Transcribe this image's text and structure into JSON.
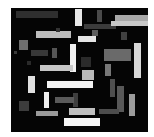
{
  "figure": {
    "width": 154,
    "height": 137,
    "background_color": "#ffffff"
  },
  "canvas": {
    "name": "black-canvas",
    "x": 11,
    "y": 8,
    "width": 137,
    "height": 124,
    "color": "#050505"
  },
  "chart_data": {
    "type": "scatter",
    "xlabel": "",
    "ylabel": "",
    "xlim": [
      0,
      137
    ],
    "ylim": [
      0,
      124
    ],
    "grid": false,
    "legend": "none",
    "note": "Abstract composition of axis-aligned grayscale rectangles on a black field.",
    "rectangles": [
      {
        "id": 1,
        "x": 5,
        "y": 3,
        "w": 42,
        "h": 7,
        "color": "#2f2f2f"
      },
      {
        "id": 2,
        "x": 64,
        "y": 1,
        "w": 7,
        "h": 17,
        "color": "#e8e8e8"
      },
      {
        "id": 3,
        "x": 86,
        "y": 2,
        "w": 5,
        "h": 12,
        "color": "#4a4a4a"
      },
      {
        "id": 4,
        "x": 104,
        "y": 7,
        "w": 36,
        "h": 6,
        "color": "#a8a8a8"
      },
      {
        "id": 5,
        "x": 73,
        "y": 16,
        "w": 32,
        "h": 5,
        "color": "#3b3b3b"
      },
      {
        "id": 6,
        "x": 100,
        "y": 13,
        "w": 38,
        "h": 5,
        "color": "#c8c8c8"
      },
      {
        "id": 7,
        "x": 25,
        "y": 23,
        "w": 35,
        "h": 7,
        "color": "#bdbdbd"
      },
      {
        "id": 8,
        "x": 8,
        "y": 32,
        "w": 9,
        "h": 10,
        "color": "#6e6e6e"
      },
      {
        "id": 9,
        "x": 67,
        "y": 28,
        "w": 18,
        "h": 6,
        "color": "#e5e5e5"
      },
      {
        "id": 10,
        "x": 3,
        "y": 43,
        "w": 3,
        "h": 3,
        "color": "#3a3a3a"
      },
      {
        "id": 11,
        "x": 20,
        "y": 42,
        "w": 17,
        "h": 6,
        "color": "#383838"
      },
      {
        "id": 12,
        "x": 41,
        "y": 40,
        "w": 5,
        "h": 10,
        "color": "#555555"
      },
      {
        "id": 13,
        "x": 59,
        "y": 36,
        "w": 6,
        "h": 28,
        "color": "#f0f0f0"
      },
      {
        "id": 14,
        "x": 93,
        "y": 41,
        "w": 27,
        "h": 12,
        "color": "#6a6a6a"
      },
      {
        "id": 15,
        "x": 123,
        "y": 35,
        "w": 7,
        "h": 35,
        "color": "#d8d8d8"
      },
      {
        "id": 16,
        "x": 70,
        "y": 49,
        "w": 10,
        "h": 10,
        "color": "#2b2b2b"
      },
      {
        "id": 17,
        "x": 29,
        "y": 57,
        "w": 33,
        "h": 6,
        "color": "#c6c6c6"
      },
      {
        "id": 18,
        "x": 71,
        "y": 62,
        "w": 12,
        "h": 10,
        "color": "#b9b9b9"
      },
      {
        "id": 19,
        "x": 17,
        "y": 68,
        "w": 7,
        "h": 17,
        "color": "#e0e0e0"
      },
      {
        "id": 20,
        "x": 36,
        "y": 73,
        "w": 46,
        "h": 7,
        "color": "#f2f2f2"
      },
      {
        "id": 21,
        "x": 99,
        "y": 71,
        "w": 5,
        "h": 18,
        "color": "#4f4f4f"
      },
      {
        "id": 22,
        "x": 33,
        "y": 84,
        "w": 5,
        "h": 16,
        "color": "#efefef"
      },
      {
        "id": 23,
        "x": 62,
        "y": 85,
        "w": 5,
        "h": 14,
        "color": "#3e3e3e"
      },
      {
        "id": 24,
        "x": 44,
        "y": 89,
        "w": 19,
        "h": 6,
        "color": "#5a5a5a"
      },
      {
        "id": 25,
        "x": 106,
        "y": 78,
        "w": 7,
        "h": 26,
        "color": "#585858"
      },
      {
        "id": 26,
        "x": 8,
        "y": 93,
        "w": 10,
        "h": 10,
        "color": "#3c3c3c"
      },
      {
        "id": 27,
        "x": 118,
        "y": 86,
        "w": 6,
        "h": 22,
        "color": "#9c9c9c"
      },
      {
        "id": 28,
        "x": 25,
        "y": 103,
        "w": 22,
        "h": 5,
        "color": "#9a9a9a"
      },
      {
        "id": 29,
        "x": 58,
        "y": 100,
        "w": 26,
        "h": 7,
        "color": "#c0c0c0"
      },
      {
        "id": 30,
        "x": 88,
        "y": 101,
        "w": 20,
        "h": 5,
        "color": "#4d4d4d"
      },
      {
        "id": 31,
        "x": 53,
        "y": 110,
        "w": 36,
        "h": 8,
        "color": "#f5f5f5"
      },
      {
        "id": 32,
        "x": 94,
        "y": 56,
        "w": 6,
        "h": 12,
        "color": "#777777"
      },
      {
        "id": 33,
        "x": 81,
        "y": 22,
        "w": 6,
        "h": 6,
        "color": "#5c5c5c"
      },
      {
        "id": 34,
        "x": 16,
        "y": 53,
        "w": 4,
        "h": 4,
        "color": "#2a2a2a"
      },
      {
        "id": 35,
        "x": 110,
        "y": 24,
        "w": 6,
        "h": 8,
        "color": "#414141"
      },
      {
        "id": 36,
        "x": 45,
        "y": 20,
        "w": 4,
        "h": 4,
        "color": "#333333"
      }
    ]
  }
}
